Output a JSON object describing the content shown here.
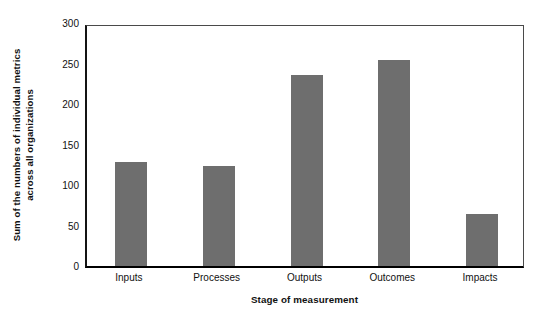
{
  "chart_data": {
    "type": "bar",
    "title": "",
    "subtitle": "",
    "xlabel": "Stage of measurement",
    "ylabel_line1": "Sum of the numbers of individual metrics",
    "ylabel_line2": "across all organizations",
    "ylabel": "Sum of the numbers of individual metrics across all organizations",
    "categories": [
      "Inputs",
      "Processes",
      "Outputs",
      "Outcomes",
      "Impacts"
    ],
    "values": [
      128,
      123,
      236,
      254,
      64
    ],
    "ylim": [
      0,
      300
    ],
    "yticks": [
      0,
      50,
      100,
      150,
      200,
      250,
      300
    ],
    "ytick_labels": [
      "0",
      "50",
      "100",
      "150",
      "200",
      "250",
      "300"
    ],
    "grid": false,
    "legend": null,
    "legend_position": "none",
    "bar_color": "#6e6e6e",
    "axis_color": "#111111",
    "background_color": "#ffffff"
  }
}
